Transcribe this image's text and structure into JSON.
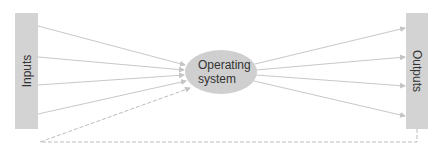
{
  "diagram": {
    "inputs_label": "Inputs",
    "outputs_label": "Outputs",
    "center_label_line1": "Operating",
    "center_label_line2": "system",
    "colors": {
      "box_fill": "#d3d3d3",
      "ellipse_fill": "#cfcfcf",
      "arrow_color": "#c8c8c8",
      "feedback_color": "#bdbdbd"
    },
    "input_arrows": 4,
    "output_arrows": 4,
    "feedback_loop": "dashed"
  }
}
